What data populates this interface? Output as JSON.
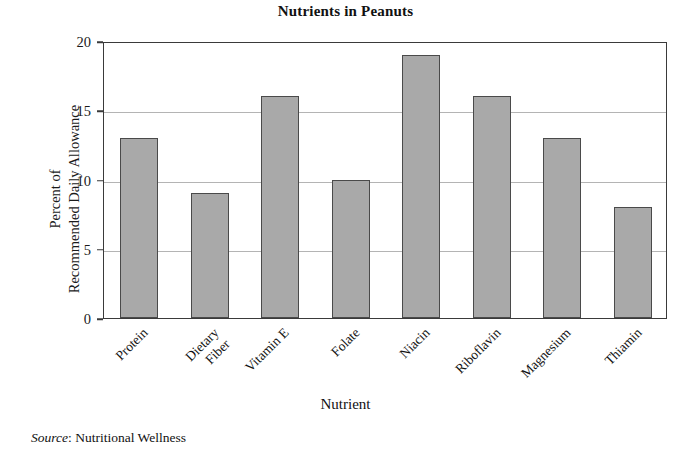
{
  "chart_data": {
    "type": "bar",
    "title": "Nutrients in Peanuts",
    "xlabel": "Nutrient",
    "ylabel": "Percent of\nRecommended Daily Allowance",
    "ylabel_lines": [
      "Percent of",
      "Recommended Daily Allowance"
    ],
    "categories": [
      "Protein",
      "Dietary Fiber",
      "Vitamin E",
      "Folate",
      "Niacin",
      "Riboflavin",
      "Magnesium",
      "Thiamin"
    ],
    "category_lines": [
      [
        "Protein"
      ],
      [
        "Dietary",
        "Fiber"
      ],
      [
        "Vitamin E"
      ],
      [
        "Folate"
      ],
      [
        "Niacin"
      ],
      [
        "Riboflavin"
      ],
      [
        "Magnesium"
      ],
      [
        "Thiamin"
      ]
    ],
    "values": [
      13,
      9,
      16,
      10,
      19,
      16,
      13,
      8
    ],
    "ylim": [
      0,
      20
    ],
    "yticks": [
      0,
      5,
      10,
      15,
      20
    ],
    "ytick_labels": [
      "0",
      "5",
      "10",
      "15",
      "20"
    ],
    "grid": true,
    "grid_axis": "y",
    "legend": false,
    "bar_color": "#a9a9a9",
    "bar_edge_color": "#4a4a4a",
    "grid_color": "#b4b4b4",
    "axis_color": "#3a3a3a",
    "background_color": "#ffffff"
  },
  "source": {
    "label": "Source",
    "separator": ": ",
    "text": "Nutritional Wellness"
  }
}
